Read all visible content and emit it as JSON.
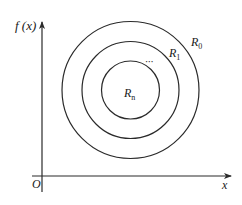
{
  "diagram": {
    "type": "nested-level-sets",
    "axes": {
      "y_label": "f (x)",
      "x_label": "x",
      "origin_label": "O"
    },
    "regions": [
      {
        "label_base": "R",
        "label_sub": "0",
        "level": "outer"
      },
      {
        "label_base": "R",
        "label_sub": "1",
        "level": "middle"
      },
      {
        "label_base": "R",
        "label_sub": "n",
        "level": "inner"
      }
    ],
    "ellipsis": "···",
    "colors": {
      "line": "#2a2a2a",
      "text": "#1a1a1a",
      "background": "#ffffff"
    }
  }
}
